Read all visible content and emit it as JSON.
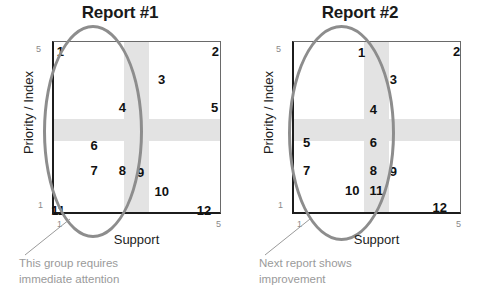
{
  "chart_data": [
    {
      "type": "scatter",
      "title": "Report #1",
      "xlabel": "Support",
      "ylabel": "Priority / Index",
      "xlim": [
        1,
        5
      ],
      "ylim": [
        1,
        5
      ],
      "xticks": [
        "1",
        "5"
      ],
      "yticks": [
        "1",
        "5"
      ],
      "grid": false,
      "legend": "none",
      "bands": {
        "vertical_color": "#e3e3e3",
        "horizontal_color": "#e3e3e3"
      },
      "annotation": "This group requires\nimmediate attention",
      "annotation_color": "#9a9a9a",
      "highlight_shape": "ellipse",
      "highlight_color": "#8d8d8d",
      "points": [
        {
          "label": "1",
          "x": 1.15,
          "y": 4.8
        },
        {
          "label": "2",
          "x": 4.82,
          "y": 4.8
        },
        {
          "label": "3",
          "x": 3.55,
          "y": 4.15
        },
        {
          "label": "4",
          "x": 2.62,
          "y": 3.5
        },
        {
          "label": "5",
          "x": 4.8,
          "y": 3.5
        },
        {
          "label": "6",
          "x": 1.95,
          "y": 2.62
        },
        {
          "label": "7",
          "x": 1.95,
          "y": 2.05
        },
        {
          "label": "8",
          "x": 2.62,
          "y": 2.05
        },
        {
          "label": "9",
          "x": 3.05,
          "y": 2.0
        },
        {
          "label": "10",
          "x": 3.55,
          "y": 1.55
        },
        {
          "label": "11",
          "x": 1.1,
          "y": 1.12
        },
        {
          "label": "12",
          "x": 4.55,
          "y": 1.12
        }
      ]
    },
    {
      "type": "scatter",
      "title": "Report #2",
      "xlabel": "Support",
      "ylabel": "Priority / Index",
      "xlim": [
        1,
        5
      ],
      "ylim": [
        1,
        5
      ],
      "xticks": [
        "1",
        "5"
      ],
      "yticks": [
        "1",
        "5"
      ],
      "grid": false,
      "legend": "none",
      "bands": {
        "vertical_color": "#e3e3e3",
        "horizontal_color": "#e3e3e3"
      },
      "annotation": "Next report shows\nimprovement",
      "annotation_color": "#9a9a9a",
      "highlight_shape": "ellipse",
      "highlight_color": "#8d8d8d",
      "points": [
        {
          "label": "1",
          "x": 2.6,
          "y": 4.78
        },
        {
          "label": "2",
          "x": 4.85,
          "y": 4.8
        },
        {
          "label": "3",
          "x": 3.35,
          "y": 4.15
        },
        {
          "label": "4",
          "x": 2.88,
          "y": 3.45
        },
        {
          "label": "5",
          "x": 1.3,
          "y": 2.68
        },
        {
          "label": "6",
          "x": 2.88,
          "y": 2.68
        },
        {
          "label": "7",
          "x": 1.3,
          "y": 2.05
        },
        {
          "label": "8",
          "x": 2.88,
          "y": 2.05
        },
        {
          "label": "9",
          "x": 3.35,
          "y": 2.02
        },
        {
          "label": "10",
          "x": 2.38,
          "y": 1.58
        },
        {
          "label": "11",
          "x": 2.95,
          "y": 1.58
        },
        {
          "label": "12",
          "x": 4.45,
          "y": 1.18
        }
      ]
    }
  ]
}
